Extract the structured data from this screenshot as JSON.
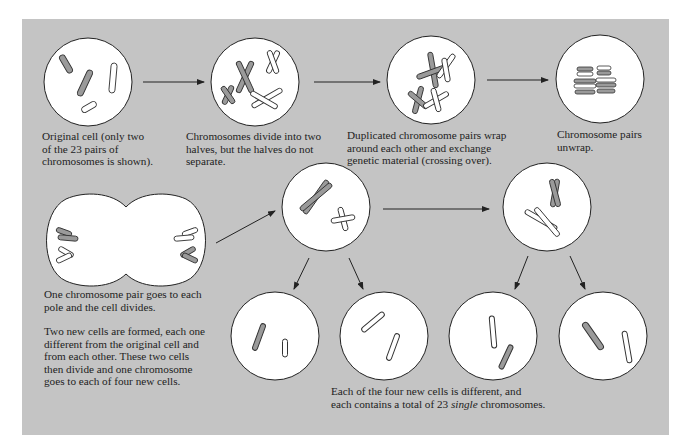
{
  "diagram": {
    "type": "meiosis-process",
    "background_color": "#c4c4c4",
    "cell_fill": "#ffffff",
    "chromosome_fill": "#9a9a9a",
    "stages": [
      {
        "id": "original",
        "caption": [
          "Original cell (only two",
          "of the 23 pairs of",
          "chromosomes is shown)."
        ]
      },
      {
        "id": "divide",
        "caption": [
          "Chromosomes divide into two",
          "halves, but the halves do not",
          "separate."
        ]
      },
      {
        "id": "crossing",
        "caption": [
          "Duplicated chromosome pairs wrap",
          "around each other and exchange",
          "genetic material (crossing over)."
        ]
      },
      {
        "id": "unwrap",
        "caption": [
          "Chromosome pairs",
          "unwrap."
        ]
      },
      {
        "id": "cell-divides",
        "caption": [
          "One chromosome pair goes to each",
          "pole and the cell divides."
        ]
      },
      {
        "id": "two-cells",
        "caption": [
          "Two new cells are formed, each one",
          "different from the original cell and",
          "from each other.  These two cells",
          "then divide and one chromosome",
          "goes to each of four new cells."
        ]
      },
      {
        "id": "four-cells",
        "caption_line1": "Each of the four new cells is different, and",
        "caption_line2_pre": "each contains a total of 23 ",
        "caption_line2_em": "single",
        "caption_line2_post": " chromosomes."
      }
    ]
  }
}
